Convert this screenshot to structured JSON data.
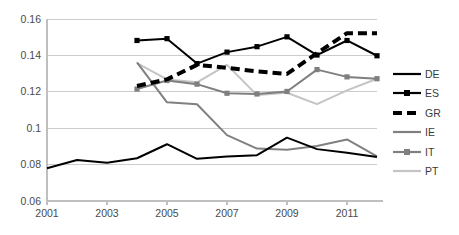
{
  "chart_data": {
    "type": "line",
    "title": "",
    "xlabel": "",
    "ylabel": "",
    "x": [
      2001,
      2002,
      2003,
      2004,
      2005,
      2006,
      2007,
      2008,
      2009,
      2010,
      2011,
      2012
    ],
    "xlim": [
      2001,
      2012
    ],
    "ylim": [
      0.06,
      0.16
    ],
    "yticks": [
      0.06,
      0.08,
      0.1,
      0.12,
      0.14,
      0.16
    ],
    "ytick_labels": [
      "0.06",
      "0.08",
      "0.1",
      "0.12",
      "0.14",
      "0.16"
    ],
    "xticks": [
      2001,
      2003,
      2005,
      2007,
      2009,
      2011
    ],
    "xtick_labels": [
      "2001",
      "2003",
      "2005",
      "2007",
      "2009",
      "2011"
    ],
    "grid": "horizontal",
    "legend_position": "right",
    "series": [
      {
        "name": "DE",
        "color": "#000000",
        "style": "solid",
        "width": 2.0,
        "marker": "none",
        "x": [
          2001,
          2002,
          2003,
          2004,
          2005,
          2006,
          2007,
          2008,
          2009,
          2010,
          2011,
          2012
        ],
        "values": [
          0.078,
          0.0825,
          0.081,
          0.0835,
          0.0912,
          0.0832,
          0.0845,
          0.0852,
          0.0948,
          0.0885,
          0.0865,
          0.0842
        ]
      },
      {
        "name": "ES",
        "color": "#000000",
        "style": "solid",
        "width": 2.0,
        "marker": "square",
        "x": [
          2004,
          2005,
          2006,
          2007,
          2008,
          2009,
          2010,
          2011,
          2012
        ],
        "values": [
          0.1482,
          0.1492,
          0.1355,
          0.1418,
          0.1448,
          0.1502,
          0.1402,
          0.1482,
          0.1398
        ]
      },
      {
        "name": "GR",
        "color": "#000000",
        "style": "dashed",
        "width": 4.0,
        "marker": "none",
        "x": [
          2004,
          2005,
          2006,
          2007,
          2008,
          2009,
          2010,
          2011,
          2012
        ],
        "values": [
          0.1232,
          0.1268,
          0.1348,
          0.1332,
          0.1312,
          0.1298,
          0.1412,
          0.1522,
          0.1522
        ]
      },
      {
        "name": "IE",
        "color": "#808080",
        "style": "solid",
        "width": 2.0,
        "marker": "none",
        "x": [
          2004,
          2005,
          2006,
          2007,
          2008,
          2009,
          2010,
          2011,
          2012
        ],
        "values": [
          0.1362,
          0.1142,
          0.1132,
          0.0962,
          0.0888,
          0.0882,
          0.0902,
          0.0938,
          0.0845
        ]
      },
      {
        "name": "IT",
        "color": "#7f7f7f",
        "style": "solid",
        "width": 2.0,
        "marker": "square",
        "x": [
          2004,
          2005,
          2006,
          2007,
          2008,
          2009,
          2010,
          2011,
          2012
        ],
        "values": [
          0.1215,
          0.1262,
          0.1242,
          0.1192,
          0.1188,
          0.1202,
          0.1322,
          0.1282,
          0.1272
        ]
      },
      {
        "name": "PT",
        "color": "#c4c4c4",
        "style": "solid",
        "width": 2.0,
        "marker": "none",
        "x": [
          2004,
          2005,
          2006,
          2007,
          2008,
          2009,
          2010,
          2011,
          2012
        ],
        "values": [
          0.1358,
          0.1268,
          0.1252,
          0.1348,
          0.1182,
          0.1195,
          0.1132,
          0.1208,
          0.1272
        ]
      }
    ]
  },
  "legend": {
    "items": [
      {
        "label": "DE",
        "color": "#000000",
        "style": "solid",
        "marker": "none",
        "width": 2.2
      },
      {
        "label": "ES",
        "color": "#000000",
        "style": "solid",
        "marker": "square",
        "width": 2.2
      },
      {
        "label": "GR",
        "color": "#000000",
        "style": "dashed",
        "marker": "none",
        "width": 4.2
      },
      {
        "label": "IE",
        "color": "#808080",
        "style": "solid",
        "marker": "none",
        "width": 2.2
      },
      {
        "label": "IT",
        "color": "#7f7f7f",
        "style": "solid",
        "marker": "square",
        "width": 2.2
      },
      {
        "label": "PT",
        "color": "#c4c4c4",
        "style": "solid",
        "marker": "none",
        "width": 2.2
      }
    ]
  },
  "axes": {
    "axis_color": "#bfbfbf",
    "grid_color": "#cccccc",
    "tick_label_color": "#4a4a4a"
  }
}
